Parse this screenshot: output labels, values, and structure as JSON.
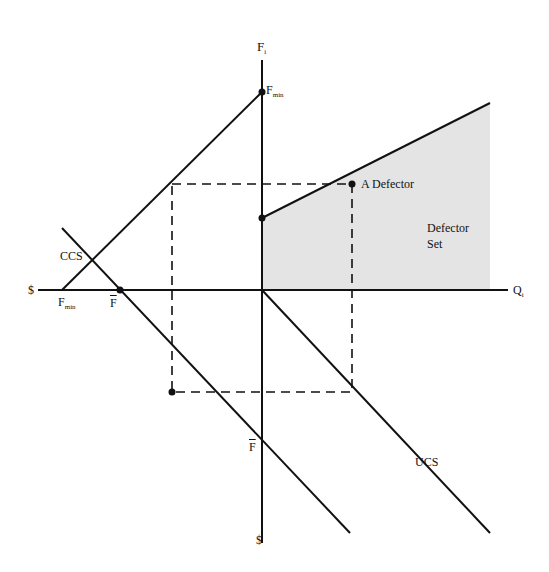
{
  "diagram": {
    "axes": {
      "vertical_top": "F",
      "vertical_top_sub": "i",
      "vertical_bottom": "$",
      "horizontal_left": "$",
      "horizontal_right": "Q",
      "horizontal_right_sub": "i"
    },
    "labels": {
      "fmin_vertical": "F",
      "fmin_vertical_sub": "min",
      "fmin_horizontal": "F",
      "fmin_horizontal_sub": "min",
      "fbar_horizontal": "F",
      "fbar_vertical": "F",
      "ccs": "CCS",
      "ucs": "UCS",
      "a_defector": "A Defector",
      "defector_set_line1": "Defector",
      "defector_set_line2": "Set"
    },
    "colors": {
      "line": "#111111",
      "shade": "#e4e4e4",
      "background": "#ffffff"
    }
  }
}
